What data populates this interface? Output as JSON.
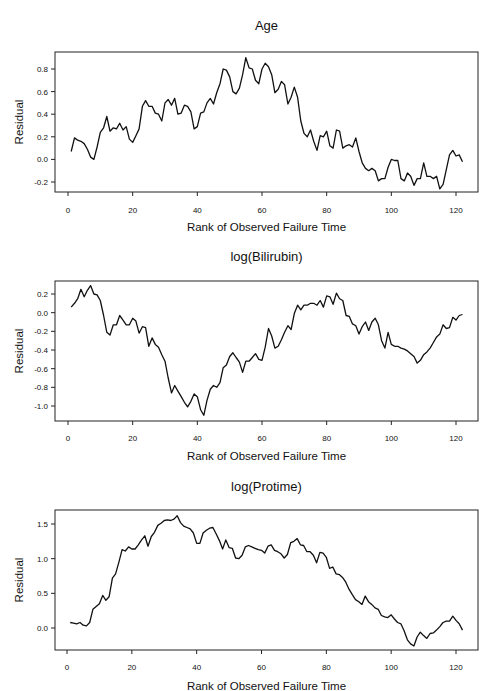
{
  "figure": {
    "panel_titles": [
      "Age",
      "log(Bilirubin)",
      "log(Protime)"
    ],
    "xlabel": "Rank of Observed Failure Time",
    "ylabel": "Residual"
  },
  "chart_data": [
    {
      "type": "line",
      "title": "Age",
      "xlabel": "Rank of Observed Failure Time",
      "ylabel": "Residual",
      "xlim": [
        -5,
        127
      ],
      "ylim": [
        -0.28,
        0.95
      ],
      "xticks": [
        0,
        20,
        40,
        60,
        80,
        100,
        120
      ],
      "xtick_labels": [
        "0",
        "20",
        "40",
        "60",
        "80",
        "100",
        "120"
      ],
      "yticks": [
        -0.2,
        0.0,
        0.2,
        0.4,
        0.6,
        0.8
      ],
      "ytick_labels": [
        "-0.2",
        "0.0",
        "0.2",
        "0.4",
        "0.6",
        "0.8"
      ],
      "grid": false,
      "legend": null,
      "series": [
        {
          "name": "Age",
          "x_start": 1,
          "values": [
            0.07,
            0.19,
            0.17,
            0.16,
            0.14,
            0.09,
            0.02,
            0.0,
            0.11,
            0.24,
            0.28,
            0.38,
            0.25,
            0.28,
            0.27,
            0.32,
            0.26,
            0.29,
            0.18,
            0.15,
            0.21,
            0.27,
            0.47,
            0.52,
            0.47,
            0.47,
            0.41,
            0.4,
            0.34,
            0.5,
            0.53,
            0.48,
            0.54,
            0.4,
            0.41,
            0.48,
            0.47,
            0.42,
            0.27,
            0.29,
            0.41,
            0.42,
            0.5,
            0.54,
            0.49,
            0.59,
            0.67,
            0.8,
            0.79,
            0.73,
            0.6,
            0.58,
            0.63,
            0.75,
            0.9,
            0.81,
            0.8,
            0.7,
            0.67,
            0.8,
            0.85,
            0.82,
            0.75,
            0.59,
            0.62,
            0.69,
            0.66,
            0.49,
            0.55,
            0.64,
            0.55,
            0.34,
            0.23,
            0.2,
            0.26,
            0.16,
            0.08,
            0.21,
            0.2,
            0.25,
            0.12,
            0.1,
            0.26,
            0.25,
            0.1,
            0.12,
            0.13,
            0.11,
            0.19,
            0.07,
            -0.03,
            -0.08,
            -0.1,
            -0.08,
            -0.1,
            -0.19,
            -0.17,
            -0.17,
            -0.07,
            0.0,
            -0.01,
            -0.01,
            -0.17,
            -0.19,
            -0.12,
            -0.15,
            -0.23,
            -0.17,
            -0.17,
            -0.03,
            -0.15,
            -0.15,
            -0.17,
            -0.15,
            -0.26,
            -0.22,
            -0.09,
            0.04,
            0.08,
            0.03,
            0.04,
            -0.02
          ]
        }
      ],
      "layout": {
        "box": [
          55,
          52,
          478,
          192
        ],
        "y_top_px": 69,
        "y_top_val": 0.8,
        "y_bot_px": 182,
        "y_bot_val": -0.2,
        "x0_px": 68,
        "x120_px": 456,
        "title_y": 30,
        "xlabel_y": 231,
        "tick_label_y": 213
      }
    },
    {
      "type": "line",
      "title": "log(Bilirubin)",
      "xlabel": "Rank of Observed Failure Time",
      "ylabel": "Residual",
      "xlim": [
        -5,
        127
      ],
      "ylim": [
        -1.15,
        0.31
      ],
      "xticks": [
        0,
        20,
        40,
        60,
        80,
        100,
        120
      ],
      "xtick_labels": [
        "0",
        "20",
        "40",
        "60",
        "80",
        "100",
        "120"
      ],
      "yticks": [
        -1.0,
        -0.8,
        -0.6,
        -0.4,
        -0.2,
        0.0,
        0.2
      ],
      "ytick_labels": [
        "-1.0",
        "-0.8",
        "-0.6",
        "-0.4",
        "-0.2",
        "0.0",
        "0.2"
      ],
      "grid": false,
      "legend": null,
      "series": [
        {
          "name": "log(Bilirubin)",
          "x_start": 1,
          "values": [
            0.06,
            0.1,
            0.15,
            0.25,
            0.17,
            0.24,
            0.29,
            0.2,
            0.19,
            0.13,
            -0.03,
            -0.21,
            -0.24,
            -0.13,
            -0.13,
            -0.03,
            -0.08,
            -0.13,
            -0.13,
            -0.06,
            -0.09,
            -0.22,
            -0.15,
            -0.16,
            -0.36,
            -0.27,
            -0.34,
            -0.37,
            -0.45,
            -0.52,
            -0.7,
            -0.86,
            -0.78,
            -0.84,
            -0.9,
            -0.96,
            -1.01,
            -0.95,
            -0.87,
            -0.9,
            -1.04,
            -1.1,
            -0.94,
            -0.82,
            -0.78,
            -0.8,
            -0.75,
            -0.59,
            -0.56,
            -0.47,
            -0.43,
            -0.48,
            -0.53,
            -0.64,
            -0.52,
            -0.52,
            -0.48,
            -0.44,
            -0.5,
            -0.51,
            -0.37,
            -0.17,
            -0.25,
            -0.38,
            -0.36,
            -0.29,
            -0.21,
            -0.14,
            -0.18,
            -0.01,
            0.08,
            0.03,
            0.08,
            0.08,
            0.1,
            0.1,
            0.08,
            0.13,
            0.06,
            0.18,
            0.17,
            0.09,
            0.21,
            0.15,
            0.13,
            -0.03,
            -0.04,
            -0.12,
            -0.14,
            -0.23,
            -0.15,
            -0.1,
            -0.19,
            -0.1,
            -0.06,
            -0.13,
            -0.3,
            -0.38,
            -0.21,
            -0.34,
            -0.36,
            -0.36,
            -0.38,
            -0.39,
            -0.41,
            -0.44,
            -0.47,
            -0.54,
            -0.51,
            -0.45,
            -0.42,
            -0.38,
            -0.32,
            -0.26,
            -0.23,
            -0.13,
            -0.17,
            -0.16,
            -0.05,
            -0.08,
            -0.03,
            -0.02
          ]
        }
      ],
      "layout": {
        "box": [
          55,
          281,
          478,
          421
        ],
        "y_top_px": 294,
        "y_top_val": 0.2,
        "y_bot_px": 406,
        "y_bot_val": -1.0,
        "x0_px": 68,
        "x120_px": 456,
        "title_y": 261,
        "xlabel_y": 460,
        "tick_label_y": 441
      }
    },
    {
      "type": "line",
      "title": "log(Protime)",
      "xlabel": "Rank of Observed Failure Time",
      "ylabel": "Residual",
      "xlim": [
        -5,
        127
      ],
      "ylim": [
        -0.32,
        1.72
      ],
      "xticks": [
        0,
        20,
        40,
        60,
        80,
        100,
        120
      ],
      "xtick_labels": [
        "0",
        "20",
        "40",
        "60",
        "80",
        "100",
        "120"
      ],
      "yticks": [
        0.0,
        0.5,
        1.0,
        1.5
      ],
      "ytick_labels": [
        "0.0",
        "0.5",
        "1.0",
        "1.5"
      ],
      "grid": false,
      "legend": null,
      "series": [
        {
          "name": "log(Protime)",
          "x_start": 1,
          "values": [
            0.08,
            0.07,
            0.06,
            0.08,
            0.04,
            0.03,
            0.08,
            0.27,
            0.31,
            0.35,
            0.47,
            0.4,
            0.45,
            0.72,
            0.78,
            0.95,
            1.13,
            1.11,
            1.17,
            1.14,
            1.14,
            1.2,
            1.27,
            1.33,
            1.18,
            1.32,
            1.38,
            1.48,
            1.51,
            1.55,
            1.56,
            1.55,
            1.57,
            1.62,
            1.52,
            1.47,
            1.45,
            1.43,
            1.37,
            1.22,
            1.22,
            1.37,
            1.41,
            1.44,
            1.45,
            1.36,
            1.26,
            1.14,
            1.27,
            1.16,
            1.15,
            1.01,
            1.0,
            1.05,
            1.17,
            1.19,
            1.17,
            1.15,
            1.13,
            1.12,
            1.08,
            1.18,
            1.2,
            1.12,
            1.1,
            1.07,
            1.01,
            1.06,
            1.23,
            1.25,
            1.29,
            1.2,
            1.19,
            1.1,
            1.1,
            1.05,
            0.94,
            1.09,
            1.08,
            1.02,
            0.86,
            0.88,
            0.78,
            0.77,
            0.73,
            0.66,
            0.56,
            0.48,
            0.41,
            0.38,
            0.34,
            0.46,
            0.38,
            0.34,
            0.29,
            0.27,
            0.18,
            0.16,
            0.15,
            0.19,
            0.13,
            0.08,
            0.06,
            -0.04,
            -0.17,
            -0.23,
            -0.26,
            -0.13,
            -0.06,
            -0.11,
            -0.15,
            -0.08,
            -0.07,
            -0.03,
            0.02,
            0.08,
            0.1,
            0.1,
            0.17,
            0.11,
            0.06,
            -0.03
          ]
        }
      ],
      "layout": {
        "box": [
          55,
          510,
          478,
          650
        ],
        "y_top_px": 524,
        "y_top_val": 1.5,
        "y_bot_px": 628,
        "y_bot_val": 0.0,
        "x0_px": 67,
        "x120_px": 456,
        "title_y": 491,
        "xlabel_y": 690,
        "tick_label_y": 670
      }
    }
  ]
}
